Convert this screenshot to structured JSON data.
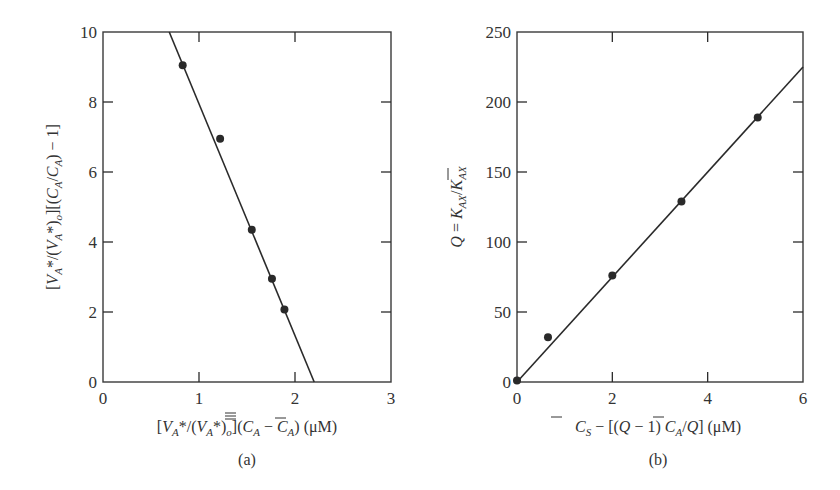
{
  "chart_data": [
    {
      "type": "scatter",
      "panel": "(a)",
      "title": "",
      "xlabel": "[V_A*/(V_A*)_o](C̿_A − C̄_A) (μM)",
      "ylabel": "[V_A*/(V_A*)_o][(C̿_A/C̄_A) − 1]",
      "xlim": [
        0,
        3
      ],
      "ylim": [
        0,
        10
      ],
      "xticks": [
        0,
        1,
        2,
        3
      ],
      "yticks": [
        0,
        2,
        4,
        6,
        8,
        10
      ],
      "grid": false,
      "series": [
        {
          "name": "data",
          "kind": "points",
          "x": [
            0.83,
            1.22,
            1.55,
            1.76,
            1.89
          ],
          "y": [
            9.05,
            6.95,
            4.35,
            2.95,
            2.07
          ]
        },
        {
          "name": "fit",
          "kind": "line",
          "x": [
            0.69,
            2.2
          ],
          "y": [
            10,
            0
          ]
        }
      ]
    },
    {
      "type": "scatter",
      "panel": "(b)",
      "title": "",
      "xlabel": "C̄_S − [(Q − 1) C̄_A/Q] (μM)",
      "ylabel": "Q = K_AX/K̄_AX",
      "xlim": [
        0,
        6
      ],
      "ylim": [
        0,
        250
      ],
      "xticks": [
        0,
        2,
        4,
        6
      ],
      "yticks": [
        0,
        50,
        100,
        150,
        200,
        250
      ],
      "grid": false,
      "series": [
        {
          "name": "data",
          "kind": "points",
          "x": [
            0,
            0.65,
            2.0,
            3.45,
            5.05
          ],
          "y": [
            1,
            32,
            76,
            129,
            189
          ]
        },
        {
          "name": "fit",
          "kind": "line",
          "x": [
            0,
            6
          ],
          "y": [
            0,
            225
          ]
        }
      ]
    }
  ],
  "panels": {
    "a": {
      "label": "(a)",
      "xticks": [
        "0",
        "1",
        "2",
        "3"
      ],
      "yticks": [
        "0",
        "2",
        "4",
        "6",
        "8",
        "10"
      ],
      "xlabel_parts": {
        "open": "[",
        "v1": "V",
        "sub_a1": "A",
        "star_slash": "*/(",
        "v2": "V",
        "sub_a2": "A",
        "star_close": "*)",
        "sub_o": "o",
        "bracket_close": "](",
        "c1": "C",
        "sub_a3": "A",
        "minus": " − ",
        "c2": "C",
        "sub_a4": "A",
        "close": ")",
        "unit": "  (μM)"
      },
      "ylabel_parts": {
        "open": "[",
        "v1": "V",
        "sub_a1": "A",
        "star_slash": "*/(",
        "v2": "V",
        "sub_a2": "A",
        "star_close": "*)",
        "sub_o": "o",
        "bracket": "][(",
        "c1": "C",
        "sub_a3": "A",
        "slash": "/",
        "c2": "C",
        "sub_a4": "A",
        "close": ") − 1]"
      }
    },
    "b": {
      "label": "(b)",
      "xticks": [
        "0",
        "2",
        "4",
        "6"
      ],
      "yticks": [
        "0",
        "50",
        "100",
        "150",
        "200",
        "250"
      ],
      "xlabel_parts": {
        "c1": "C",
        "sub_s": "S",
        "mid": " − [(",
        "q1": "Q",
        "minus1": " − 1) ",
        "c2": "C",
        "sub_a": "A",
        "slash": "/",
        "q2": "Q",
        "close": "]",
        "unit": "  (μM)"
      },
      "ylabel_parts": {
        "q": "Q",
        "eq": " = ",
        "k1": "K",
        "sub1": "AX",
        "slash": "/",
        "k2": "K",
        "sub2": "AX"
      }
    }
  },
  "colors": {
    "ink": "#2a2a2a",
    "background": "#ffffff"
  }
}
